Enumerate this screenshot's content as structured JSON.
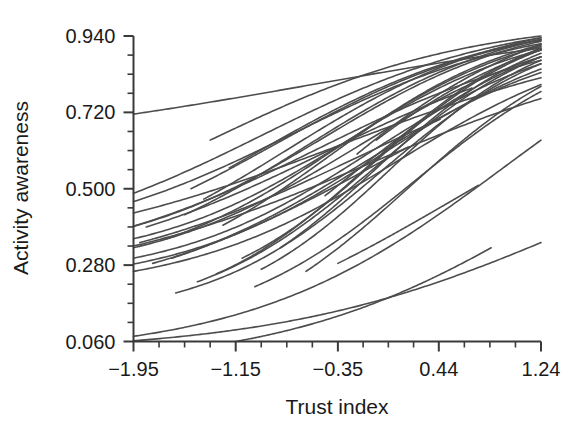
{
  "chart_data": {
    "type": "line",
    "title": "",
    "subtitle": "",
    "xlabel": "Trust index",
    "ylabel": "Activity awareness",
    "xlim": [
      -2.35,
      1.24
    ],
    "ylim": [
      0.06,
      0.94
    ],
    "grid": false,
    "legend": false,
    "legend_position": "none",
    "x_ticks_labeled": [
      -1.95,
      -1.15,
      -0.35,
      0.44,
      1.24
    ],
    "x_tick_labels": [
      "−1.95",
      "−1.15",
      "−0.35",
      "0.44",
      "1.24"
    ],
    "x_minor_tick_count_between": 3,
    "y_ticks_labeled": [
      0.94,
      0.72,
      0.5,
      0.28,
      0.06
    ],
    "y_tick_labels": [
      "0.940",
      "0.720",
      "0.500",
      "0.280",
      "0.060"
    ],
    "y_minor_tick_count_between": 3,
    "line_color": "#4d4d4d",
    "line_width": 1.6,
    "axis_color": "#3a3a3a",
    "series": [
      {
        "name": "curve-01",
        "x_start": -1.95,
        "x_end": 1.24,
        "y_start": 0.715,
        "y_end": 0.905,
        "slope": 0.62,
        "midpoint": -0.55
      },
      {
        "name": "curve-02",
        "x_start": -1.95,
        "x_end": 1.24,
        "y_start": 0.487,
        "y_end": 0.935,
        "slope": 1.05,
        "midpoint": -0.95
      },
      {
        "name": "curve-03",
        "x_start": -1.95,
        "x_end": 1.24,
        "y_start": 0.463,
        "y_end": 0.918,
        "slope": 1.1,
        "midpoint": -0.7
      },
      {
        "name": "curve-04",
        "x_start": -1.95,
        "x_end": 1.24,
        "y_start": 0.392,
        "y_end": 0.925,
        "slope": 1.25,
        "midpoint": -0.45
      },
      {
        "name": "curve-05",
        "x_start": -1.95,
        "x_end": 1.24,
        "y_start": 0.356,
        "y_end": 0.9,
        "slope": 1.3,
        "midpoint": -0.3
      },
      {
        "name": "curve-06",
        "x_start": -1.95,
        "x_end": 1.24,
        "y_start": 0.33,
        "y_end": 0.88,
        "slope": 1.2,
        "midpoint": -0.2
      },
      {
        "name": "curve-07",
        "x_start": -1.95,
        "x_end": 1.24,
        "y_start": 0.3,
        "y_end": 0.86,
        "slope": 1.28,
        "midpoint": -0.1
      },
      {
        "name": "curve-08",
        "x_start": -1.95,
        "x_end": 1.24,
        "y_start": 0.283,
        "y_end": 0.845,
        "slope": 1.22,
        "midpoint": 0.0
      },
      {
        "name": "curve-09",
        "x_start": -1.95,
        "x_end": 1.24,
        "y_start": 0.262,
        "y_end": 0.8,
        "slope": 1.18,
        "midpoint": 0.12
      },
      {
        "name": "curve-10",
        "x_start": -1.95,
        "x_end": 1.24,
        "y_start": 0.075,
        "y_end": 0.64,
        "slope": 1.0,
        "midpoint": 0.95
      },
      {
        "name": "curve-11",
        "x_start": -1.62,
        "x_end": 1.24,
        "y_start": 0.2,
        "y_end": 0.86,
        "slope": 1.45,
        "midpoint": 0.0
      },
      {
        "name": "curve-12",
        "x_start": -1.45,
        "x_end": 1.24,
        "y_start": 0.232,
        "y_end": 0.88,
        "slope": 1.4,
        "midpoint": -0.05
      },
      {
        "name": "curve-13",
        "x_start": -1.3,
        "x_end": 1.24,
        "y_start": 0.255,
        "y_end": 0.905,
        "slope": 1.5,
        "midpoint": -0.1
      },
      {
        "name": "curve-14",
        "x_start": -1.55,
        "x_end": 1.24,
        "y_start": 0.425,
        "y_end": 0.93,
        "slope": 1.2,
        "midpoint": -0.6
      },
      {
        "name": "curve-15",
        "x_start": -1.4,
        "x_end": 1.24,
        "y_start": 0.47,
        "y_end": 0.935,
        "slope": 1.15,
        "midpoint": -0.75
      },
      {
        "name": "curve-16",
        "x_start": -1.7,
        "x_end": 1.24,
        "y_start": 0.355,
        "y_end": 0.91,
        "slope": 1.3,
        "midpoint": -0.35
      },
      {
        "name": "curve-17",
        "x_start": -1.1,
        "x_end": 1.24,
        "y_start": 0.3,
        "y_end": 0.9,
        "slope": 1.55,
        "midpoint": -0.05
      },
      {
        "name": "curve-18",
        "x_start": -0.95,
        "x_end": 1.24,
        "y_start": 0.268,
        "y_end": 0.87,
        "slope": 1.6,
        "midpoint": 0.05
      },
      {
        "name": "curve-19",
        "x_start": -0.8,
        "x_end": 1.24,
        "y_start": 0.33,
        "y_end": 0.89,
        "slope": 1.55,
        "midpoint": -0.05
      },
      {
        "name": "curve-20",
        "x_start": -1.25,
        "x_end": 1.24,
        "y_start": 0.395,
        "y_end": 0.915,
        "slope": 1.35,
        "midpoint": -0.4
      },
      {
        "name": "curve-21",
        "x_start": -1.85,
        "x_end": 0.7,
        "y_start": 0.39,
        "y_end": 0.79,
        "slope": 1.0,
        "midpoint": -0.45
      },
      {
        "name": "curve-22",
        "x_start": -1.9,
        "x_end": 0.45,
        "y_start": 0.345,
        "y_end": 0.7,
        "slope": 0.95,
        "midpoint": -0.2
      },
      {
        "name": "curve-23",
        "x_start": -1.65,
        "x_end": 0.2,
        "y_start": 0.3,
        "y_end": 0.62,
        "slope": 0.9,
        "midpoint": 0.0
      },
      {
        "name": "curve-24",
        "x_start": -1.0,
        "x_end": 1.24,
        "y_start": 0.218,
        "y_end": 0.78,
        "slope": 1.35,
        "midpoint": 0.25
      },
      {
        "name": "curve-25",
        "x_start": -0.6,
        "x_end": 1.24,
        "y_start": 0.262,
        "y_end": 0.795,
        "slope": 1.4,
        "midpoint": 0.2
      },
      {
        "name": "curve-26",
        "x_start": -0.35,
        "x_end": 0.75,
        "y_start": 0.285,
        "y_end": 0.51,
        "slope": 0.85,
        "midpoint": 0.6
      },
      {
        "name": "curve-27",
        "x_start": -1.95,
        "x_end": 1.24,
        "y_start": 0.062,
        "y_end": 0.345,
        "slope": 0.85,
        "midpoint": 1.55
      },
      {
        "name": "curve-28",
        "x_start": -1.15,
        "x_end": 0.85,
        "y_start": 0.06,
        "y_end": 0.33,
        "slope": 0.95,
        "midpoint": 1.35
      },
      {
        "name": "curve-29",
        "x_start": -1.95,
        "x_end": 1.24,
        "y_start": 0.392,
        "y_end": 0.87,
        "slope": 1.0,
        "midpoint": -0.5
      },
      {
        "name": "curve-30",
        "x_start": -1.8,
        "x_end": 1.24,
        "y_start": 0.285,
        "y_end": 0.835,
        "slope": 1.15,
        "midpoint": -0.15
      },
      {
        "name": "curve-31",
        "x_start": -1.5,
        "x_end": 1.24,
        "y_start": 0.5,
        "y_end": 0.928,
        "slope": 1.1,
        "midpoint": -0.85
      },
      {
        "name": "curve-32",
        "x_start": -1.2,
        "x_end": 1.24,
        "y_start": 0.56,
        "y_end": 0.93,
        "slope": 1.05,
        "midpoint": -1.0
      },
      {
        "name": "curve-33",
        "x_start": -0.45,
        "x_end": 1.24,
        "y_start": 0.48,
        "y_end": 0.88,
        "slope": 1.2,
        "midpoint": -0.3
      },
      {
        "name": "curve-34",
        "x_start": -0.2,
        "x_end": 1.24,
        "y_start": 0.6,
        "y_end": 0.915,
        "slope": 1.1,
        "midpoint": -0.6
      },
      {
        "name": "curve-35",
        "x_start": -1.95,
        "x_end": 1.24,
        "y_start": 0.335,
        "y_end": 0.76,
        "slope": 0.85,
        "midpoint": -0.1
      },
      {
        "name": "curve-36",
        "x_start": -1.35,
        "x_end": 1.24,
        "y_start": 0.64,
        "y_end": 0.94,
        "slope": 1.0,
        "midpoint": -1.35
      },
      {
        "name": "curve-37",
        "x_start": -0.05,
        "x_end": 1.24,
        "y_start": 0.64,
        "y_end": 0.9,
        "slope": 1.05,
        "midpoint": -0.7
      },
      {
        "name": "curve-38",
        "x_start": -1.95,
        "x_end": 1.24,
        "y_start": 0.43,
        "y_end": 0.82,
        "slope": 0.8,
        "midpoint": -0.3
      }
    ]
  },
  "axes": {
    "x_axis_name": "trust-index-axis",
    "y_axis_name": "activity-awareness-axis"
  }
}
